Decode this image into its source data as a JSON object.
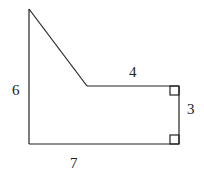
{
  "diagram": {
    "type": "geometry-figure",
    "shape": "pentagon",
    "side_labels": {
      "left": "6",
      "top": "4",
      "right": "3",
      "bottom": "7"
    },
    "right_angle_markers": [
      "top-right",
      "bottom-right"
    ],
    "line_color": "#222222",
    "background": "#ffffff"
  }
}
